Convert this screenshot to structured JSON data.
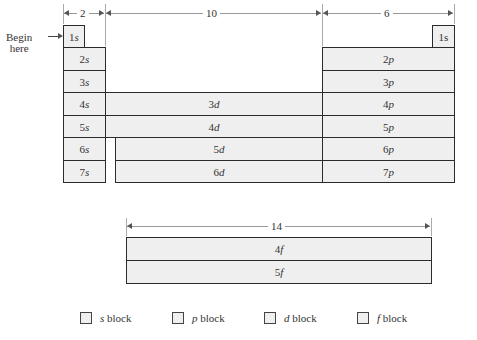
{
  "dimensions": {
    "s_width": "2",
    "d_width": "10",
    "p_width": "6",
    "f_width": "14"
  },
  "annotation": {
    "begin_line1": "Begin",
    "begin_line2": "here"
  },
  "s_block": [
    {
      "n": "1",
      "l": "s"
    },
    {
      "n": "2",
      "l": "s"
    },
    {
      "n": "3",
      "l": "s"
    },
    {
      "n": "4",
      "l": "s"
    },
    {
      "n": "5",
      "l": "s"
    },
    {
      "n": "6",
      "l": "s"
    },
    {
      "n": "7",
      "l": "s"
    }
  ],
  "helium_cell": {
    "n": "1",
    "l": "s"
  },
  "p_block": [
    {
      "n": "2",
      "l": "p"
    },
    {
      "n": "3",
      "l": "p"
    },
    {
      "n": "4",
      "l": "p"
    },
    {
      "n": "5",
      "l": "p"
    },
    {
      "n": "6",
      "l": "p"
    },
    {
      "n": "7",
      "l": "p"
    }
  ],
  "d_block": [
    {
      "n": "3",
      "l": "d"
    },
    {
      "n": "4",
      "l": "d"
    },
    {
      "n": "5",
      "l": "d"
    },
    {
      "n": "6",
      "l": "d"
    }
  ],
  "f_block": [
    {
      "n": "4",
      "l": "f"
    },
    {
      "n": "5",
      "l": "f"
    }
  ],
  "legend": [
    {
      "letter": "s",
      "text": " block"
    },
    {
      "letter": "p",
      "text": " block"
    },
    {
      "letter": "d",
      "text": " block"
    },
    {
      "letter": "f",
      "text": " block"
    }
  ],
  "colors": {
    "cell_fill": "#efefef",
    "border": "#2b2b2b"
  }
}
